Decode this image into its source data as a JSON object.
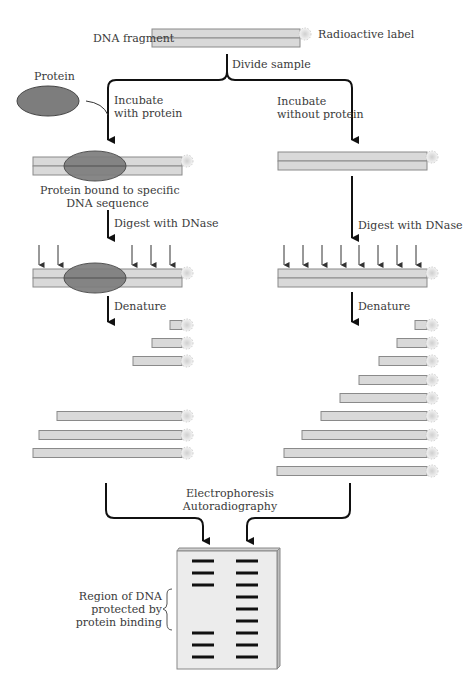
{
  "labels": {
    "dna_fragment": "DNA fragment",
    "radioactive_label": "Radioactive label",
    "divide_sample": "Divide sample",
    "protein": "Protein",
    "incubate_with_1": "Incubate",
    "incubate_with_2": "with protein",
    "incubate_without_1": "Incubate",
    "incubate_without_2": "without protein",
    "bound_1": "Protein bound to specific",
    "bound_2": "DNA sequence",
    "digest_left": "Digest with DNase",
    "digest_right": "Digest with DNase",
    "denature_left": "Denature",
    "denature_right": "Denature",
    "electro_1": "Electrophoresis",
    "electro_2": "Autoradiography",
    "region_1": "Region of DNA",
    "region_2": "protected by",
    "region_3": "protein binding"
  },
  "colors": {
    "dna_fill": "#d9d9d9",
    "dna_stroke": "#8a8a8a",
    "protein_fill": "#7d7d7d",
    "protein_stroke": "#444444",
    "arrow": "#111111",
    "gel_fill": "#ececec",
    "band": "#111111"
  },
  "left_fragments": [
    {
      "x1": 170,
      "y": 325
    },
    {
      "x1": 152,
      "y": 343
    },
    {
      "x1": 133,
      "y": 361
    },
    {
      "x1": 57,
      "y": 416
    },
    {
      "x1": 39,
      "y": 435
    },
    {
      "x1": 33,
      "y": 453
    }
  ],
  "right_fragments": [
    {
      "x1": 415,
      "y": 325
    },
    {
      "x1": 397,
      "y": 343
    },
    {
      "x1": 379,
      "y": 361
    },
    {
      "x1": 359,
      "y": 380
    },
    {
      "x1": 340,
      "y": 398
    },
    {
      "x1": 321,
      "y": 416
    },
    {
      "x1": 302,
      "y": 435
    },
    {
      "x1": 284,
      "y": 453
    },
    {
      "x1": 277,
      "y": 471
    }
  ],
  "gel": {
    "left_lane_bands": [
      561,
      573,
      585,
      633,
      645,
      657
    ],
    "right_lane_bands": [
      561,
      573,
      585,
      597,
      609,
      621,
      633,
      645,
      657
    ]
  },
  "dnase_cuts": {
    "left": [
      39,
      58,
      132,
      151,
      170
    ],
    "right": [
      284,
      303,
      322,
      341,
      359,
      378,
      397,
      416
    ]
  }
}
